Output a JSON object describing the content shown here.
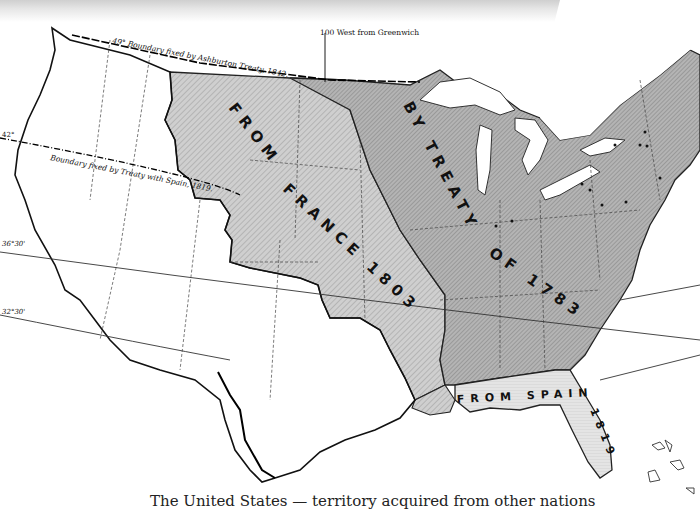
{
  "map": {
    "title": "Territorial acquisitions of the United States",
    "regions": [
      {
        "label_line1": "FROM",
        "label_line2": "FRANCE 1803",
        "name": "Louisiana Purchase",
        "shade": "#c9c9c9"
      },
      {
        "label_line1": "BY TREATY",
        "label_line2": "OF 1783",
        "name": "Original territory by Treaty of 1783",
        "shade": "#a9a9a9"
      },
      {
        "label_line1": "FROM SPAIN",
        "label_line2": "1819",
        "name": "Florida cession",
        "shade": "#e0e0e0"
      }
    ],
    "annotations": {
      "meridian": "100 West from Greenwich",
      "north_boundary": "49° Boundary fixed by Ashburton Treaty, 1842.",
      "spain_boundary": "Boundary fixed by Treaty with Spain, 1819.",
      "lat_42": "42°",
      "lat_36_30": "36°30'",
      "lat_32_30": "32°30'"
    },
    "caption": "The United States — territory acquired from other nations"
  }
}
